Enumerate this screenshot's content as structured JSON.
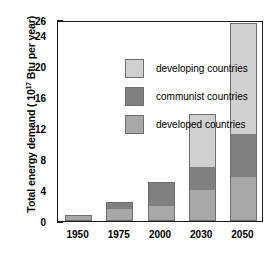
{
  "chart_data": {
    "type": "bar",
    "stacked": true,
    "title": "",
    "xlabel": "",
    "ylabel": "Total energy demand (10¹⁷ Btu per year)",
    "ylabel_text": "Total energy demand ( 10",
    "ylabel_exponent": "17",
    "ylabel_tail": " Btu per year)",
    "categories": [
      "1950",
      "1975",
      "2000",
      "2030",
      "2050"
    ],
    "ylim": [
      0,
      26
    ],
    "yticks": [
      0,
      4,
      8,
      12,
      16,
      20,
      24,
      26
    ],
    "ytick_labels": [
      "0",
      "4",
      "8",
      "12",
      "16",
      "20",
      "24",
      "26"
    ],
    "grid": false,
    "legend_position": "upper-left-inside",
    "series": [
      {
        "name": "developed countries",
        "color": "#a8a8a8",
        "values": [
          0.6,
          1.5,
          2.0,
          4.0,
          5.7
        ]
      },
      {
        "name": "communist countries",
        "color": "#808080",
        "values": [
          0.2,
          1.0,
          3.0,
          3.0,
          5.6
        ]
      },
      {
        "name": "developing countries",
        "color": "#d0d0d0",
        "values": [
          0.0,
          0.0,
          0.0,
          6.8,
          14.3
        ]
      }
    ],
    "totals": [
      0.8,
      2.5,
      5.0,
      13.8,
      25.6
    ]
  },
  "legend": {
    "entries": [
      {
        "label": "developing countries",
        "color": "#d0d0d0"
      },
      {
        "label": "communist countries",
        "color": "#808080"
      },
      {
        "label": "developed countries",
        "color": "#a8a8a8"
      }
    ]
  },
  "colors": {
    "axis": "#1a1a1a",
    "bar_outline": "#6e6e6e",
    "background": "#ffffff",
    "developing": "#d0d0d0",
    "communist": "#808080",
    "developed": "#a8a8a8"
  }
}
